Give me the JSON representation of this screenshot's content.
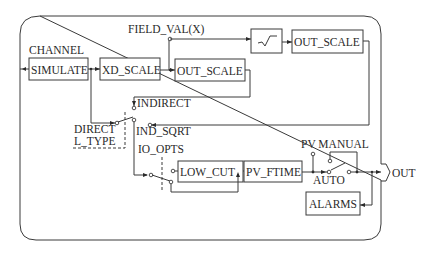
{
  "diagram": {
    "type": "function block diagram",
    "labels": {
      "field_val": "FIELD_VAL(X)",
      "channel": "CHANNEL",
      "indirect": "INDIRECT",
      "direct": "DIRECT",
      "l_type": "L_TYPE",
      "ind_sqrt": "IND_SQRT",
      "io_opts": "IO_OPTS",
      "pv_manual": "PV MANUAL",
      "auto": "AUTO",
      "out": "OUT"
    },
    "blocks": {
      "simulate": "SIMULATE",
      "xd_scale": "XD_SCALE",
      "out_scale_1": "OUT_SCALE",
      "sqrt": "square-root",
      "out_scale_2": "OUT_SCALE",
      "low_cut": "LOW_CUT",
      "pv_ftime": "PV_FTIME",
      "alarms": "ALARMS"
    },
    "colors": {
      "line": "#3a3a3a",
      "text": "#2a2a2a",
      "background": "#ffffff"
    }
  }
}
